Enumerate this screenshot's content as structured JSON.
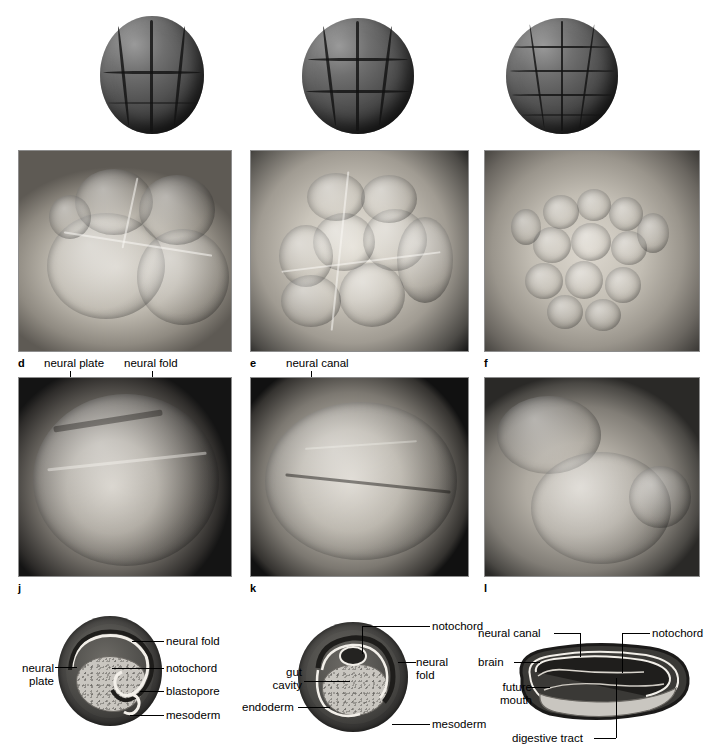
{
  "figure": {
    "columns": 3,
    "rows": 4
  },
  "row_models": {
    "description": "Clay/plaster models of cleavage stages",
    "items": [
      {
        "name": "model-8-cell",
        "stage_label": ""
      },
      {
        "name": "model-16-cell",
        "stage_label": ""
      },
      {
        "name": "model-blastula",
        "stage_label": ""
      }
    ]
  },
  "row_cleavage": {
    "panels": [
      {
        "letter": "d",
        "name": "sem-cleavage-early"
      },
      {
        "letter": "e",
        "name": "sem-cleavage-mid"
      },
      {
        "letter": "f",
        "name": "sem-blastula"
      }
    ],
    "callouts": [
      {
        "text": "neural plate",
        "panel": "d"
      },
      {
        "text": "neural fold",
        "panel": "d"
      },
      {
        "text": "neural canal",
        "panel": "e"
      }
    ]
  },
  "row_neurula": {
    "panels": [
      {
        "letter": "j",
        "name": "sem-neurula-dorsal"
      },
      {
        "letter": "k",
        "name": "sem-neural-tube"
      },
      {
        "letter": "l",
        "name": "sem-tailbud"
      }
    ]
  },
  "row_diagrams": [
    {
      "name": "diagram-neurula",
      "labels_left": [
        {
          "text_line1": "neural",
          "text_line2": "plate"
        }
      ],
      "labels_right": [
        {
          "text": "neural fold"
        },
        {
          "text": "notochord"
        },
        {
          "text": "blastopore"
        },
        {
          "text": "mesoderm"
        }
      ]
    },
    {
      "name": "diagram-neural-tube",
      "labels_left": [
        {
          "text_line1": "gut",
          "text_line2": "cavity"
        },
        {
          "text_line1": "endoderm",
          "text_line2": ""
        }
      ],
      "labels_right": [
        {
          "text": "notochord"
        },
        {
          "text_line1": "neural",
          "text_line2": "fold"
        },
        {
          "text": "mesoderm"
        }
      ]
    },
    {
      "name": "diagram-tailbud",
      "labels_left": [
        {
          "text_line1": "neural canal",
          "text_line2": ""
        },
        {
          "text_line1": "brain",
          "text_line2": ""
        },
        {
          "text_line1": "future",
          "text_line2": "mouth"
        }
      ],
      "labels_right": [
        {
          "text": "notochord"
        }
      ],
      "labels_bottom": [
        {
          "text": "digestive tract"
        }
      ]
    }
  ],
  "colors": {
    "page_background": "#ffffff",
    "text": "#000000",
    "photo_border": "#8d8d8d",
    "yolk_fill": "#c9c6c0",
    "tissue_dark": "#2b2a28"
  }
}
